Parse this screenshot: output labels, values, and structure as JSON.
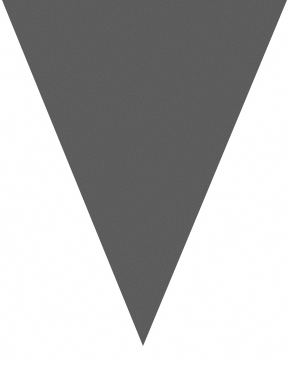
{
  "canvas": {
    "width": 292,
    "height": 366,
    "background_color": "#ffffff",
    "description": "Plain white canvas containing a single large solid shape, no text or interface chrome"
  },
  "shape": {
    "name": "inverted-triangle",
    "kind": "triangle",
    "orientation": "pointing-down",
    "fill_color": "#585858",
    "stroke": "none",
    "texture": "fine grain / noise speckle",
    "points": "2,0 287,0 143,346",
    "vertices": [
      {
        "label": "top-left",
        "x": 2,
        "y": 0
      },
      {
        "label": "top-right",
        "x": 287,
        "y": 0
      },
      {
        "label": "bottom-apex",
        "x": 143,
        "y": 346
      }
    ],
    "top_edge_width": 285,
    "height": 346
  }
}
